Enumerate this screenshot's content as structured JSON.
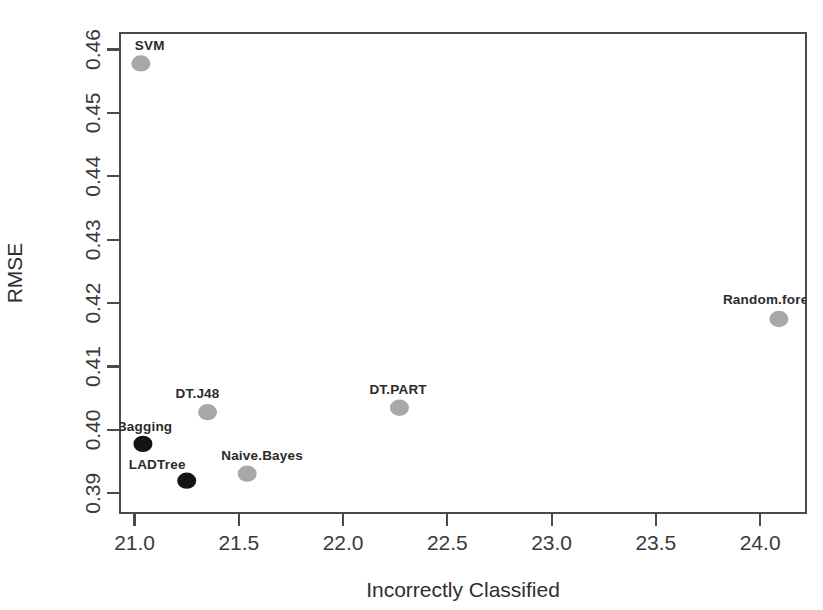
{
  "chart_data": {
    "type": "scatter",
    "title": "",
    "xlabel": "Incorrectly Classified",
    "ylabel": "RMSE",
    "xlim": [
      20.93,
      24.22
    ],
    "ylim": [
      0.3869,
      0.4626
    ],
    "xticks": [
      "21.0",
      "21.5",
      "22.0",
      "22.5",
      "23.0",
      "23.5",
      "24.0"
    ],
    "xtick_values": [
      21.0,
      21.5,
      22.0,
      22.5,
      23.0,
      23.5,
      24.0
    ],
    "yticks": [
      "0.39",
      "0.40",
      "0.41",
      "0.42",
      "0.43",
      "0.44",
      "0.45",
      "0.46"
    ],
    "ytick_values": [
      0.39,
      0.4,
      0.41,
      0.42,
      0.43,
      0.44,
      0.45,
      0.46
    ],
    "grid": false,
    "legend": "none",
    "colors": {
      "gray_point": "#a8a8a8",
      "black_point": "#141414",
      "axis": "#4a4a4a",
      "text": "#2e2e2e",
      "background": "#ffffff"
    },
    "points": [
      {
        "label": "SVM",
        "x": 21.03,
        "y": 0.4578,
        "color": "#a8a8a8",
        "label_dx": -6,
        "label_dy": -13,
        "label_anchor": "start"
      },
      {
        "label": "Bagging",
        "x": 21.04,
        "y": 0.3978,
        "color": "#141414",
        "label_dx": -26,
        "label_dy": -13,
        "label_anchor": "start"
      },
      {
        "label": "LADTree",
        "x": 21.25,
        "y": 0.392,
        "color": "#141414",
        "label_dx": -58,
        "label_dy": -12,
        "label_anchor": "start"
      },
      {
        "label": "DT.J48",
        "x": 21.35,
        "y": 0.4028,
        "color": "#a8a8a8",
        "label_dx": -32,
        "label_dy": -14,
        "label_anchor": "start"
      },
      {
        "label": "Naive.Bayes",
        "x": 21.54,
        "y": 0.3931,
        "color": "#a8a8a8",
        "label_dx": -26,
        "label_dy": -14,
        "label_anchor": "start"
      },
      {
        "label": "DT.PART",
        "x": 22.27,
        "y": 0.4035,
        "color": "#a8a8a8",
        "label_dx": -30,
        "label_dy": -14,
        "label_anchor": "start"
      },
      {
        "label": "Random.fore",
        "x": 24.09,
        "y": 0.4175,
        "color": "#a8a8a8",
        "label_dx": -56,
        "label_dy": -15,
        "label_anchor": "start"
      }
    ]
  },
  "plot": {
    "frame": {
      "left": 120,
      "top": 33,
      "right": 806,
      "bottom": 513
    },
    "point_radius": 9.5,
    "xaxis_title": "Incorrectly Classified",
    "yaxis_title": "RMSE"
  }
}
